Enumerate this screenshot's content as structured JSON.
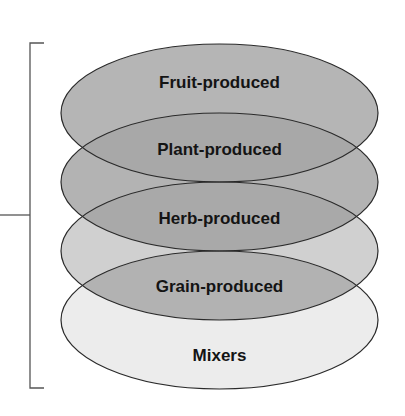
{
  "diagram": {
    "type": "stacked-overlapping-ellipses",
    "layers": [
      {
        "label": "Fruit-produced",
        "fill": "#b5b5b5"
      },
      {
        "label": "Plant-produced",
        "fill": "#b3b3b3"
      },
      {
        "label": "Herb-produced",
        "fill": "#d0d0d0"
      },
      {
        "label": "Grain-produced",
        "fill": "#ececec"
      },
      {
        "label": "Mixers",
        "fill": "#ececec"
      }
    ],
    "overlap_fills": [
      "#a8a8a8",
      "#a9a9a9",
      "#b2b2b2"
    ],
    "stroke": "#2a2a2a",
    "bracket_color": "#555555"
  }
}
